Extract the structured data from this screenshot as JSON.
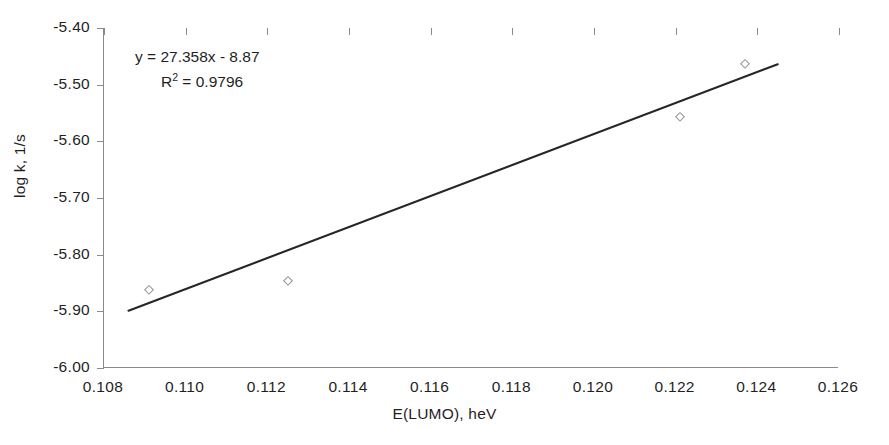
{
  "chart_data": {
    "type": "scatter",
    "title": "",
    "xlabel": "E(LUMO), heV",
    "ylabel": "log k, 1/s",
    "xlim": [
      0.108,
      0.126
    ],
    "ylim": [
      -6.0,
      -5.4
    ],
    "xticks": [
      "0.108",
      "0.110",
      "0.112",
      "0.114",
      "0.116",
      "0.118",
      "0.120",
      "0.122",
      "0.124",
      "0.126"
    ],
    "xtick_values": [
      0.108,
      0.11,
      0.112,
      0.114,
      0.116,
      0.118,
      0.12,
      0.122,
      0.124,
      0.126
    ],
    "yticks": [
      "-5.40",
      "-5.50",
      "-5.60",
      "-5.70",
      "-5.80",
      "-5.90",
      "-6.00"
    ],
    "ytick_values": [
      -5.4,
      -5.5,
      -5.6,
      -5.7,
      -5.8,
      -5.9,
      -6.0
    ],
    "grid": false,
    "legend": false,
    "marker_style": "open-diamond",
    "marker_color": "#909090",
    "line_color": "#262626",
    "points": [
      {
        "x": 0.1091,
        "y": -5.862
      },
      {
        "x": 0.1125,
        "y": -5.847
      },
      {
        "x": 0.1221,
        "y": -5.557
      },
      {
        "x": 0.1237,
        "y": -5.464
      }
    ],
    "trendline": {
      "slope": 27.358,
      "intercept": -8.87,
      "r_squared": 0.9796,
      "x_start": 0.1086,
      "x_end": 0.1245
    },
    "annotations": {
      "equation": "y = 27.358x - 8.87",
      "r_squared_prefix": "R",
      "r_squared_exponent": "2",
      "r_squared_value": " = 0.9796"
    }
  }
}
